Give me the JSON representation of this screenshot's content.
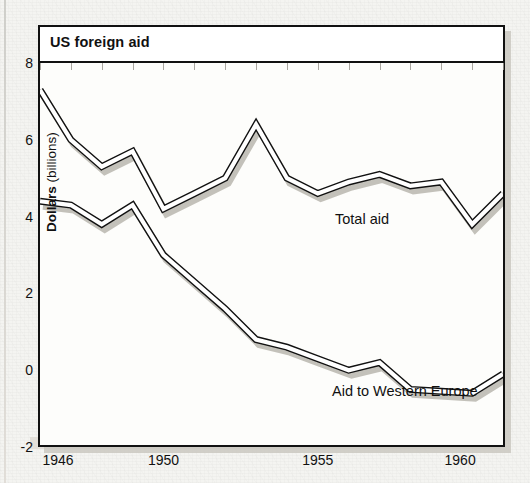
{
  "chart_data": {
    "type": "line",
    "title": "US foreign aid",
    "xlabel": "",
    "ylabel": "Dollars (billions)",
    "ylabel_bold_part": "Dollars",
    "ylabel_rest": " (billions)",
    "xlim": [
      1946,
      1961
    ],
    "ylim": [
      -2,
      8
    ],
    "yticks": [
      -2,
      0,
      2,
      4,
      6,
      8
    ],
    "ytick_labels": [
      "-2",
      "0",
      "2",
      "4",
      "6",
      "8"
    ],
    "xticks": [
      1946,
      1950,
      1955,
      1960
    ],
    "xtick_labels": [
      "1946",
      "1950",
      "1955",
      "1960"
    ],
    "grid": false,
    "legend_position": "inline-annotations",
    "x": [
      1946,
      1947,
      1948,
      1949,
      1950,
      1951,
      1952,
      1953,
      1954,
      1955,
      1956,
      1957,
      1958,
      1959,
      1960,
      1961
    ],
    "series": [
      {
        "name": "Total aid",
        "label_text": "Total aid",
        "values": [
          7.3,
          6.0,
          5.3,
          5.7,
          4.2,
          4.6,
          5.0,
          6.4,
          5.0,
          4.6,
          4.9,
          5.1,
          4.8,
          4.9,
          3.8,
          4.6
        ]
      },
      {
        "name": "Aid to Western Europe",
        "label_text": "Aid to Western Europe",
        "values": [
          4.4,
          4.3,
          3.8,
          4.3,
          3.0,
          2.3,
          1.6,
          0.8,
          0.6,
          0.3,
          0.0,
          0.2,
          -0.5,
          -0.55,
          -0.6,
          -0.1
        ]
      }
    ],
    "colors": {
      "line_stroke": "#111111",
      "line_fill": "#ffffff",
      "shadow": "#bdbab3",
      "paper": "#f4f4f1",
      "plot_bg": "#fdfdfb"
    }
  },
  "annotations": {
    "total_aid": "Total aid",
    "western_europe": "Aid to Western Europe"
  }
}
